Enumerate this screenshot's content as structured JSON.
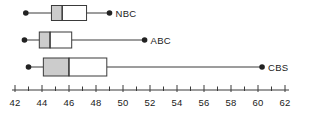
{
  "chart_data": {
    "type": "box",
    "title": "",
    "xlabel": "",
    "ylabel": "",
    "orientation": "horizontal",
    "xlim": [
      42,
      62
    ],
    "xticks": [
      42,
      43,
      44,
      45,
      46,
      47,
      48,
      49,
      50,
      51,
      52,
      53,
      54,
      55,
      56,
      57,
      58,
      59,
      60,
      61,
      62
    ],
    "xtick_labels": [
      "42",
      "",
      "44",
      "",
      "46",
      "",
      "48",
      "",
      "50",
      "",
      "52",
      "",
      "54",
      "",
      "56",
      "",
      "58",
      "",
      "60",
      "",
      "62"
    ],
    "major_tick_values": [
      42,
      44,
      46,
      48,
      50,
      52,
      54,
      56,
      58,
      60,
      62
    ],
    "grid": false,
    "legend": "right-of-plot",
    "box_fill_lower": "#cccccc",
    "box_fill_upper": "#ffffff",
    "line_color": "#3a3a3a",
    "dot_color": "#222222",
    "series": [
      {
        "name": "NBC",
        "min": 42.8,
        "q1": 44.7,
        "median": 45.5,
        "q3": 47.3,
        "max": 49.0
      },
      {
        "name": "ABC",
        "min": 42.7,
        "q1": 43.8,
        "median": 44.6,
        "q3": 46.2,
        "max": 51.6
      },
      {
        "name": "CBS",
        "min": 43.0,
        "q1": 44.1,
        "median": 46.0,
        "q3": 48.8,
        "max": 60.3
      }
    ]
  }
}
